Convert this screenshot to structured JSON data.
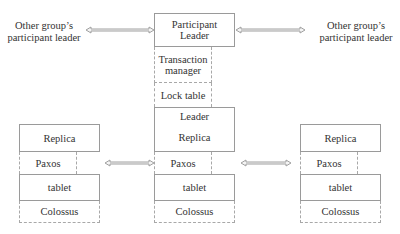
{
  "external_labels": {
    "left": "Other group’s participant leader",
    "right": "Other group’s participant leader"
  },
  "center_group": {
    "participant_leader": "Participant Leader",
    "transaction_manager": "Transaction manager",
    "lock_table": "Lock table",
    "leader": "Leader",
    "replica": "Replica",
    "paxos": "Paxos",
    "tablet": "tablet",
    "colossus": "Colossus"
  },
  "left_group": {
    "replica": "Replica",
    "paxos": "Paxos",
    "tablet": "tablet",
    "colossus": "Colossus"
  },
  "right_group": {
    "replica": "Replica",
    "paxos": "Paxos",
    "tablet": "tablet",
    "colossus": "Colossus"
  },
  "arrows": [
    {
      "from": "left-external-label",
      "to": "participant-leader",
      "type": "bidirectional"
    },
    {
      "from": "participant-leader",
      "to": "right-external-label",
      "type": "bidirectional"
    },
    {
      "from": "left-paxos",
      "to": "center-paxos",
      "type": "bidirectional"
    },
    {
      "from": "center-paxos",
      "to": "right-paxos",
      "type": "bidirectional"
    }
  ],
  "colors": {
    "box_border": "#9a9a9a",
    "dashed_border": "#a8a8a8",
    "arrow": "#a0a0a0",
    "text": "#333333"
  }
}
